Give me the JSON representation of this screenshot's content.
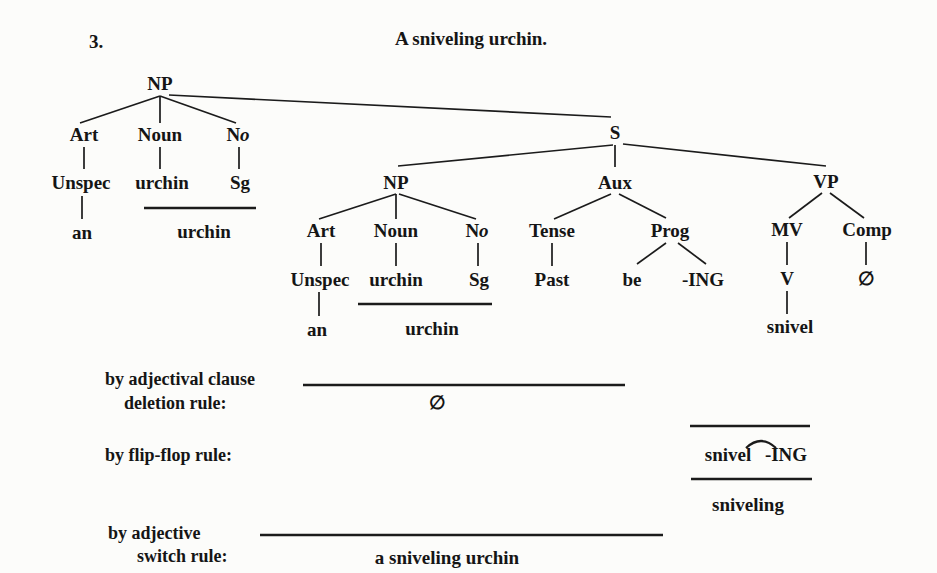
{
  "header": {
    "item_number": "3.",
    "title": "A sniveling urchin."
  },
  "matrix_np": {
    "root": "NP",
    "art": "Art",
    "noun": "Noun",
    "no_n": "N",
    "no_o": "o",
    "unspec": "Unspec",
    "noun_word": "urchin",
    "sg": "Sg",
    "art_word": "an",
    "merged_word": "urchin"
  },
  "s_clause": {
    "root": "S",
    "np": {
      "root": "NP",
      "art": "Art",
      "noun": "Noun",
      "no_n": "N",
      "no_o": "o",
      "unspec": "Unspec",
      "noun_word": "urchin",
      "sg": "Sg",
      "art_word": "an",
      "merged_word": "urchin"
    },
    "aux": {
      "root": "Aux",
      "tense": "Tense",
      "prog": "Prog",
      "past": "Past",
      "be": "be",
      "ing": "-ING"
    },
    "vp": {
      "root": "VP",
      "mv": "MV",
      "comp": "Comp",
      "v": "V",
      "comp_null": "∅",
      "verb_word": "snivel"
    }
  },
  "rules": {
    "adjectival_clause_deletion": {
      "label_line1": "by adjectival clause",
      "label_line2": "deletion rule:",
      "result": "∅"
    },
    "flip_flop": {
      "label": "by flip-flop rule:",
      "expr_left": "snivel",
      "expr_right": "-ING",
      "result": "sniveling"
    },
    "adjective_switch": {
      "label_line1": "by adjective",
      "label_line2": "switch rule:",
      "result": "a sniveling urchin"
    }
  }
}
